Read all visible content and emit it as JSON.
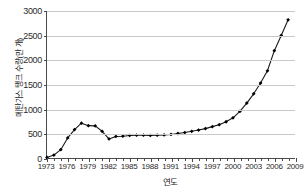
{
  "chart_data": {
    "type": "line",
    "title": "",
    "xlabel": "연도",
    "ylabel": "메탄가스 탱크 수량(만 개)",
    "xlim": [
      1973,
      2009
    ],
    "ylim": [
      0,
      3000
    ],
    "ytick_labels": [
      "0",
      "500",
      "1000",
      "1500",
      "2000",
      "2500",
      "3000"
    ],
    "ytick_values": [
      0,
      500,
      1000,
      1500,
      2000,
      2500,
      3000
    ],
    "xtick_labels": [
      "1973",
      "1976",
      "1979",
      "1982",
      "1985",
      "1988",
      "1991",
      "1994",
      "1997",
      "2000",
      "2003",
      "2006",
      "2009"
    ],
    "xtick_values": [
      1973,
      1976,
      1979,
      1982,
      1985,
      1988,
      1991,
      1994,
      1997,
      2000,
      2003,
      2006,
      2009
    ],
    "grid": "horizontal",
    "legend": "none",
    "marker": "filled-diamond",
    "line_color": "#1a1a1a",
    "marker_color": "#000000",
    "grid_color": "#c9c9c9",
    "axis_color": "#4a4a4a",
    "x": [
      1973,
      1974,
      1975,
      1976,
      1977,
      1978,
      1979,
      1980,
      1981,
      1982,
      1983,
      1984,
      1985,
      1986,
      1987,
      1988,
      1989,
      1990,
      1991,
      1992,
      1993,
      1994,
      1995,
      1996,
      1997,
      1998,
      1999,
      2000,
      2001,
      2002,
      2003,
      2004,
      2005,
      2006,
      2007,
      2008
    ],
    "values": [
      10,
      60,
      170,
      410,
      580,
      710,
      660,
      655,
      545,
      390,
      440,
      445,
      460,
      465,
      465,
      460,
      465,
      470,
      480,
      500,
      520,
      545,
      570,
      600,
      640,
      680,
      740,
      820,
      950,
      1120,
      1310,
      1530,
      1780,
      2190,
      2500,
      2820
    ],
    "series": [
      {
        "name": "메탄가스 탱크 수량",
        "values": [
          10,
          60,
          170,
          410,
          580,
          710,
          660,
          655,
          545,
          390,
          440,
          445,
          460,
          465,
          465,
          460,
          465,
          470,
          480,
          500,
          520,
          545,
          570,
          600,
          640,
          680,
          740,
          820,
          950,
          1120,
          1310,
          1530,
          1780,
          2190,
          2500,
          2820
        ]
      }
    ]
  }
}
